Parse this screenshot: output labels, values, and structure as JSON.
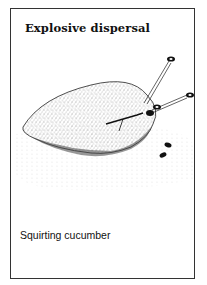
{
  "card": {
    "title": "Explosive dispersal",
    "caption": "Squirting cucumber"
  },
  "illustration": {
    "subject": "squirting-cucumber-fruit",
    "seeds_ejected": 5
  }
}
